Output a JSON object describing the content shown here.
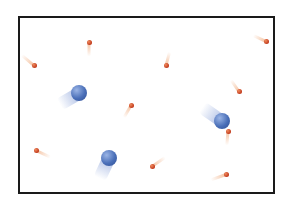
{
  "diagram": {
    "title": "",
    "container": {
      "x": 18,
      "y": 16,
      "width": 257,
      "height": 178,
      "border_color": "#1a1a1a"
    },
    "colors": {
      "large_particle": "#4a6fb8",
      "large_particle_highlight": "#9bb5e6",
      "large_particle_trail": "#9fb3e0",
      "small_particle": "#c0391b",
      "small_particle_highlight": "#f08a5d",
      "small_particle_trail": "#f2b78f"
    },
    "large_particles": [
      {
        "x": 79,
        "y": 93,
        "r": 8,
        "trail_angle": 150,
        "trail_length": 22
      },
      {
        "x": 222,
        "y": 121,
        "r": 8,
        "trail_angle": 215,
        "trail_length": 24
      },
      {
        "x": 109,
        "y": 158,
        "r": 8,
        "trail_angle": 115,
        "trail_length": 22
      }
    ],
    "small_particles": [
      {
        "x": 34,
        "y": 65,
        "trail_angle": 220,
        "trail_length": 16
      },
      {
        "x": 89,
        "y": 42,
        "trail_angle": 90,
        "trail_length": 14
      },
      {
        "x": 166,
        "y": 65,
        "trail_angle": 285,
        "trail_length": 14
      },
      {
        "x": 266,
        "y": 41,
        "trail_angle": 205,
        "trail_length": 14
      },
      {
        "x": 239,
        "y": 91,
        "trail_angle": 235,
        "trail_length": 14
      },
      {
        "x": 131,
        "y": 105,
        "trail_angle": 120,
        "trail_length": 14
      },
      {
        "x": 228,
        "y": 131,
        "trail_angle": 95,
        "trail_length": 14
      },
      {
        "x": 36,
        "y": 150,
        "trail_angle": 25,
        "trail_length": 16
      },
      {
        "x": 152,
        "y": 166,
        "trail_angle": 325,
        "trail_length": 16
      },
      {
        "x": 226,
        "y": 174,
        "trail_angle": 160,
        "trail_length": 16
      }
    ]
  }
}
